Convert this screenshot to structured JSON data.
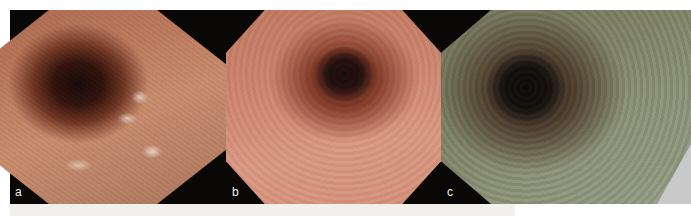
{
  "figure": {
    "panels": [
      {
        "id": "a",
        "label": "a",
        "description": "Endoscopic view of esophageal lumen with whitish plaques, reddish mucosa"
      },
      {
        "id": "b",
        "label": "b",
        "description": "Endoscopic view of esophageal lumen with diffuse reddish mucosa and small white spots"
      },
      {
        "id": "c",
        "label": "c",
        "description": "Endoscopic view with greenish-tinted (image-enhanced) mucosa surrounding dark lumen"
      }
    ]
  }
}
